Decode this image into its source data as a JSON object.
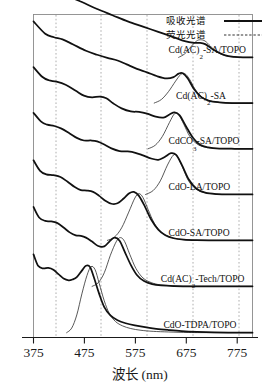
{
  "figure": {
    "title": "",
    "legend": {
      "position": "top-right",
      "items": [
        {
          "label": "吸收光谱",
          "style": "solid",
          "name": "absorption"
        },
        {
          "label": "荧光光谱",
          "style": "dashed",
          "name": "fluorescence"
        }
      ]
    }
  },
  "chart_data": {
    "type": "line",
    "title": "",
    "subtitle": "",
    "xlabel": "波长 (nm)",
    "ylabel": "",
    "xlim": [
      375,
      805
    ],
    "xticks": [
      375,
      475,
      575,
      675,
      775
    ],
    "xticklabels": [
      "375",
      "475",
      "575",
      "675",
      "775"
    ],
    "gridlines_x": [
      425,
      525,
      625,
      725,
      775
    ],
    "grid": true,
    "grid_style": "dotted-vertical",
    "ylim": [
      0,
      1
    ],
    "yticks": [],
    "yticklabels": [],
    "stacked_offset": true,
    "legend_entries": [
      "吸收光谱",
      "荧光光谱"
    ],
    "series": [
      {
        "name": "Cd(AC)2-SA/TOPO",
        "label_text": "Cd(AC)",
        "label_sub": "2",
        "label_tail": "-SA/TOPO",
        "label_x": 640,
        "abs_peak_nm": 700,
        "pl_peak_nm": 712,
        "abs_points": [
          [
            375,
            0.98
          ],
          [
            400,
            0.86
          ],
          [
            420,
            0.8
          ],
          [
            445,
            0.74
          ],
          [
            470,
            0.68
          ],
          [
            500,
            0.6
          ],
          [
            530,
            0.53
          ],
          [
            560,
            0.46
          ],
          [
            590,
            0.4
          ],
          [
            620,
            0.34
          ],
          [
            650,
            0.28
          ],
          [
            672,
            0.235
          ],
          [
            690,
            0.215
          ],
          [
            700,
            0.215
          ],
          [
            712,
            0.2
          ],
          [
            730,
            0.13
          ],
          [
            750,
            0.075
          ],
          [
            770,
            0.055
          ],
          [
            790,
            0.05
          ],
          [
            805,
            0.05
          ]
        ],
        "pl_points": [
          [
            660,
            0.05
          ],
          [
            672,
            0.09
          ],
          [
            684,
            0.17
          ],
          [
            695,
            0.235
          ],
          [
            703,
            0.25
          ],
          [
            712,
            0.235
          ],
          [
            722,
            0.18
          ],
          [
            734,
            0.115
          ],
          [
            748,
            0.075
          ],
          [
            762,
            0.058
          ],
          [
            780,
            0.05
          ],
          [
            805,
            0.05
          ]
        ]
      },
      {
        "name": "Cd(AC)2-SA",
        "label_text": "Cd(AC)",
        "label_sub": "2",
        "label_tail": "-SA",
        "label_x": 655,
        "abs_peak_nm": 660,
        "pl_peak_nm": 672,
        "abs_points": [
          [
            375,
            0.98
          ],
          [
            398,
            0.84
          ],
          [
            415,
            0.8
          ],
          [
            432,
            0.775
          ],
          [
            452,
            0.72
          ],
          [
            478,
            0.645
          ],
          [
            500,
            0.6
          ],
          [
            520,
            0.565
          ],
          [
            540,
            0.535
          ],
          [
            558,
            0.49
          ],
          [
            578,
            0.44
          ],
          [
            598,
            0.4
          ],
          [
            618,
            0.355
          ],
          [
            636,
            0.33
          ],
          [
            650,
            0.345
          ],
          [
            660,
            0.385
          ],
          [
            668,
            0.39
          ],
          [
            678,
            0.33
          ],
          [
            690,
            0.21
          ],
          [
            704,
            0.12
          ],
          [
            720,
            0.075
          ],
          [
            740,
            0.058
          ],
          [
            765,
            0.05
          ],
          [
            805,
            0.05
          ]
        ],
        "pl_points": [
          [
            612,
            0.05
          ],
          [
            626,
            0.09
          ],
          [
            640,
            0.18
          ],
          [
            654,
            0.3
          ],
          [
            664,
            0.375
          ],
          [
            672,
            0.385
          ],
          [
            681,
            0.325
          ],
          [
            692,
            0.21
          ],
          [
            704,
            0.125
          ],
          [
            718,
            0.08
          ],
          [
            738,
            0.058
          ],
          [
            760,
            0.05
          ],
          [
            805,
            0.05
          ]
        ]
      },
      {
        "name": "CdCO3-SA/TOPO",
        "label_text": "CdCO",
        "label_sub": "3",
        "label_tail": "-SA/TOPO",
        "label_x": 640,
        "abs_peak_nm": 650,
        "pl_peak_nm": 655,
        "abs_points": [
          [
            375,
            0.98
          ],
          [
            392,
            0.87
          ],
          [
            405,
            0.83
          ],
          [
            420,
            0.815
          ],
          [
            438,
            0.78
          ],
          [
            458,
            0.71
          ],
          [
            474,
            0.655
          ],
          [
            490,
            0.635
          ],
          [
            505,
            0.645
          ],
          [
            518,
            0.625
          ],
          [
            532,
            0.565
          ],
          [
            548,
            0.51
          ],
          [
            566,
            0.475
          ],
          [
            582,
            0.47
          ],
          [
            598,
            0.45
          ],
          [
            615,
            0.415
          ],
          [
            630,
            0.405
          ],
          [
            642,
            0.44
          ],
          [
            652,
            0.465
          ],
          [
            662,
            0.43
          ],
          [
            674,
            0.31
          ],
          [
            688,
            0.175
          ],
          [
            702,
            0.095
          ],
          [
            718,
            0.065
          ],
          [
            740,
            0.052
          ],
          [
            770,
            0.05
          ],
          [
            805,
            0.05
          ]
        ],
        "pl_points": [
          [
            600,
            0.05
          ],
          [
            614,
            0.09
          ],
          [
            628,
            0.19
          ],
          [
            642,
            0.35
          ],
          [
            652,
            0.45
          ],
          [
            660,
            0.44
          ],
          [
            670,
            0.33
          ],
          [
            682,
            0.19
          ],
          [
            696,
            0.105
          ],
          [
            712,
            0.068
          ],
          [
            735,
            0.053
          ],
          [
            765,
            0.05
          ],
          [
            805,
            0.05
          ]
        ]
      },
      {
        "name": "CdO-LA/TOPO",
        "label_text": "CdO-LA/TOPO",
        "label_sub": "",
        "label_tail": "",
        "label_x": 640,
        "abs_peak_nm": 645,
        "pl_peak_nm": 652,
        "abs_points": [
          [
            375,
            0.98
          ],
          [
            390,
            0.88
          ],
          [
            402,
            0.845
          ],
          [
            416,
            0.83
          ],
          [
            430,
            0.8
          ],
          [
            446,
            0.745
          ],
          [
            460,
            0.695
          ],
          [
            474,
            0.665
          ],
          [
            488,
            0.665
          ],
          [
            500,
            0.655
          ],
          [
            514,
            0.62
          ],
          [
            528,
            0.575
          ],
          [
            544,
            0.545
          ],
          [
            560,
            0.54
          ],
          [
            575,
            0.525
          ],
          [
            590,
            0.495
          ],
          [
            606,
            0.46
          ],
          [
            620,
            0.445
          ],
          [
            632,
            0.475
          ],
          [
            645,
            0.52
          ],
          [
            655,
            0.5
          ],
          [
            666,
            0.39
          ],
          [
            680,
            0.22
          ],
          [
            695,
            0.115
          ],
          [
            712,
            0.07
          ],
          [
            735,
            0.054
          ],
          [
            765,
            0.05
          ],
          [
            805,
            0.05
          ]
        ],
        "pl_points": [
          [
            595,
            0.05
          ],
          [
            610,
            0.095
          ],
          [
            624,
            0.205
          ],
          [
            638,
            0.385
          ],
          [
            650,
            0.5
          ],
          [
            658,
            0.48
          ],
          [
            668,
            0.355
          ],
          [
            680,
            0.2
          ],
          [
            695,
            0.11
          ],
          [
            712,
            0.07
          ],
          [
            738,
            0.053
          ],
          [
            768,
            0.05
          ],
          [
            805,
            0.05
          ]
        ]
      },
      {
        "name": "CdO-SA/TOPO",
        "label_text": "CdO-SA/TOPO",
        "label_sub": "",
        "label_tail": "",
        "label_x": 640,
        "abs_peak_nm": 565,
        "pl_peak_nm": 582,
        "abs_points": [
          [
            375,
            0.96
          ],
          [
            388,
            0.84
          ],
          [
            400,
            0.8
          ],
          [
            414,
            0.79
          ],
          [
            428,
            0.77
          ],
          [
            442,
            0.715
          ],
          [
            456,
            0.655
          ],
          [
            468,
            0.62
          ],
          [
            480,
            0.615
          ],
          [
            492,
            0.6
          ],
          [
            504,
            0.555
          ],
          [
            516,
            0.5
          ],
          [
            528,
            0.465
          ],
          [
            540,
            0.47
          ],
          [
            552,
            0.525
          ],
          [
            563,
            0.585
          ],
          [
            572,
            0.6
          ],
          [
            582,
            0.555
          ],
          [
            594,
            0.43
          ],
          [
            606,
            0.285
          ],
          [
            620,
            0.17
          ],
          [
            634,
            0.105
          ],
          [
            650,
            0.072
          ],
          [
            670,
            0.056
          ],
          [
            695,
            0.05
          ],
          [
            730,
            0.048
          ],
          [
            805,
            0.048
          ]
        ],
        "pl_points": [
          [
            520,
            0.048
          ],
          [
            534,
            0.085
          ],
          [
            548,
            0.19
          ],
          [
            562,
            0.37
          ],
          [
            574,
            0.53
          ],
          [
            582,
            0.58
          ],
          [
            590,
            0.535
          ],
          [
            600,
            0.4
          ],
          [
            612,
            0.245
          ],
          [
            626,
            0.14
          ],
          [
            642,
            0.088
          ],
          [
            660,
            0.062
          ],
          [
            682,
            0.052
          ],
          [
            710,
            0.048
          ],
          [
            805,
            0.048
          ]
        ]
      },
      {
        "name": "Cd(AC)2-Tech/TOPO",
        "label_text": "Cd(AC)",
        "label_sub": "2",
        "label_tail": "-Tech/TOPO",
        "label_x": 625,
        "abs_peak_nm": 530,
        "pl_peak_nm": 545,
        "abs_points": [
          [
            375,
            0.95
          ],
          [
            386,
            0.83
          ],
          [
            398,
            0.79
          ],
          [
            410,
            0.785
          ],
          [
            422,
            0.765
          ],
          [
            434,
            0.715
          ],
          [
            446,
            0.66
          ],
          [
            458,
            0.625
          ],
          [
            468,
            0.62
          ],
          [
            478,
            0.6
          ],
          [
            490,
            0.555
          ],
          [
            502,
            0.505
          ],
          [
            514,
            0.5
          ],
          [
            524,
            0.555
          ],
          [
            534,
            0.6
          ],
          [
            544,
            0.565
          ],
          [
            554,
            0.44
          ],
          [
            566,
            0.29
          ],
          [
            578,
            0.175
          ],
          [
            592,
            0.105
          ],
          [
            608,
            0.07
          ],
          [
            626,
            0.055
          ],
          [
            650,
            0.048
          ],
          [
            690,
            0.045
          ],
          [
            805,
            0.045
          ]
        ],
        "pl_points": [
          [
            490,
            0.045
          ],
          [
            502,
            0.085
          ],
          [
            514,
            0.2
          ],
          [
            526,
            0.4
          ],
          [
            538,
            0.56
          ],
          [
            546,
            0.6
          ],
          [
            554,
            0.555
          ],
          [
            564,
            0.41
          ],
          [
            576,
            0.25
          ],
          [
            590,
            0.14
          ],
          [
            606,
            0.088
          ],
          [
            624,
            0.062
          ],
          [
            648,
            0.052
          ],
          [
            685,
            0.046
          ],
          [
            805,
            0.045
          ]
        ]
      },
      {
        "name": "CdO-TDPA/TOPO",
        "label_text": "CdO-TDPA/TOPO",
        "label_sub": "",
        "label_tail": "",
        "label_x": 630,
        "abs_peak_nm": 480,
        "pl_peak_nm": 492,
        "abs_points": [
          [
            375,
            0.93
          ],
          [
            384,
            0.8
          ],
          [
            394,
            0.77
          ],
          [
            404,
            0.775
          ],
          [
            414,
            0.755
          ],
          [
            424,
            0.705
          ],
          [
            434,
            0.655
          ],
          [
            444,
            0.635
          ],
          [
            452,
            0.645
          ],
          [
            460,
            0.67
          ],
          [
            470,
            0.745
          ],
          [
            478,
            0.8
          ],
          [
            486,
            0.785
          ],
          [
            494,
            0.66
          ],
          [
            504,
            0.48
          ],
          [
            514,
            0.33
          ],
          [
            526,
            0.235
          ],
          [
            540,
            0.18
          ],
          [
            556,
            0.145
          ],
          [
            574,
            0.12
          ],
          [
            594,
            0.1
          ],
          [
            616,
            0.082
          ],
          [
            640,
            0.068
          ],
          [
            666,
            0.055
          ],
          [
            696,
            0.046
          ],
          [
            730,
            0.04
          ],
          [
            770,
            0.038
          ],
          [
            805,
            0.038
          ]
        ],
        "pl_points": [
          [
            440,
            0.038
          ],
          [
            450,
            0.09
          ],
          [
            460,
            0.24
          ],
          [
            470,
            0.48
          ],
          [
            480,
            0.69
          ],
          [
            488,
            0.79
          ],
          [
            496,
            0.755
          ],
          [
            504,
            0.6
          ],
          [
            514,
            0.4
          ],
          [
            524,
            0.255
          ],
          [
            536,
            0.165
          ],
          [
            550,
            0.115
          ],
          [
            566,
            0.085
          ],
          [
            586,
            0.065
          ],
          [
            610,
            0.053
          ],
          [
            640,
            0.046
          ],
          [
            680,
            0.04
          ],
          [
            730,
            0.038
          ],
          [
            805,
            0.038
          ]
        ]
      }
    ]
  }
}
